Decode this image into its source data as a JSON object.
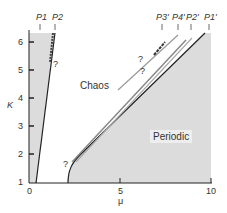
{
  "figure": {
    "region_labels": {
      "chaos": "Chaos",
      "periodic": "Periodic"
    },
    "axes": {
      "x_label": "μ",
      "y_label": "K",
      "x_ticks": [
        "0",
        "5",
        "10"
      ],
      "y_ticks": [
        "1",
        "2",
        "3",
        "4",
        "5",
        "6"
      ]
    },
    "boundary_labels": {
      "left": [
        "P1",
        "P2"
      ],
      "right": [
        "P3'",
        "P4'",
        "P2'",
        "P1'"
      ]
    },
    "uncertain_marker": "?",
    "colors": {
      "periodic_fill": "#dcdcdc",
      "line": "#222222",
      "background": "#ffffff"
    }
  }
}
